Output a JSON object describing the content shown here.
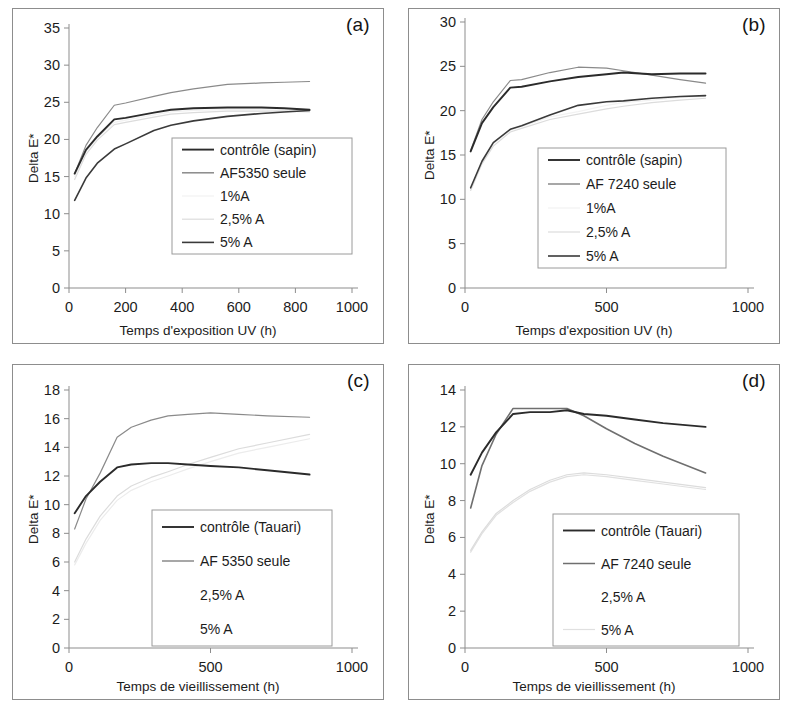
{
  "figure": {
    "background": "#ffffff",
    "axis_color": "#8d8d8d",
    "panel_count": 4
  },
  "colors": {
    "dark": "#2b2b2b",
    "mid_dark": "#4a4a4a",
    "gray": "#8a8a8a",
    "light_gray": "#c9c9c9",
    "very_light": "#e3e3e3",
    "frame": "#8d8d8d",
    "text": "#1c1c1c"
  },
  "panels": {
    "a": {
      "tag": "(a)",
      "ylabel": "Delta E*",
      "xlabel": "Temps d'exposition UV (h)",
      "legend": [
        {
          "label": "contrôle (sapin)",
          "color": "#2b2b2b",
          "width": 1.9,
          "show_line": true
        },
        {
          "label": "AF5350 seule",
          "color": "#8a8a8a",
          "width": 1.5,
          "show_line": true
        },
        {
          "label": "1%A",
          "color": "#f2f2f2",
          "width": 1.2,
          "show_line": true
        },
        {
          "label": "2,5% A",
          "color": "#dcdcdc",
          "width": 1.2,
          "show_line": true
        },
        {
          "label": "5% A",
          "color": "#3a3a3a",
          "width": 1.6,
          "show_line": true
        }
      ]
    },
    "b": {
      "tag": "(b)",
      "ylabel": "Delta E*",
      "xlabel": "Temps d'exposition UV (h)",
      "legend": [
        {
          "label": "contrôle (sapin)",
          "color": "#2b2b2b",
          "width": 1.9,
          "show_line": true
        },
        {
          "label": "AF 7240 seule",
          "color": "#8a8a8a",
          "width": 1.5,
          "show_line": true
        },
        {
          "label": "1%A",
          "color": "#f2f2f2",
          "width": 1.2,
          "show_line": true
        },
        {
          "label": "2,5% A",
          "color": "#dcdcdc",
          "width": 1.2,
          "show_line": true
        },
        {
          "label": "5% A",
          "color": "#3a3a3a",
          "width": 1.6,
          "show_line": true
        }
      ]
    },
    "c": {
      "tag": "(c)",
      "ylabel": "Delta E*",
      "xlabel": "Temps de vieillissement (h)",
      "legend": [
        {
          "label": "contrôle (Tauari)",
          "color": "#2b2b2b",
          "width": 1.9,
          "show_line": true
        },
        {
          "label": "AF 5350 seule",
          "color": "#8a8a8a",
          "width": 1.5,
          "show_line": true
        },
        {
          "label": "2,5% A",
          "color": "#dcdcdc",
          "width": 1.2,
          "show_line": false
        },
        {
          "label": "5% A",
          "color": "#ececec",
          "width": 1.2,
          "show_line": false
        }
      ]
    },
    "d": {
      "tag": "(d)",
      "ylabel": "Delta E*",
      "xlabel": "Temps de vieillissement (h)",
      "legend": [
        {
          "label": "contrôle (Tauari)",
          "color": "#2b2b2b",
          "width": 1.9,
          "show_line": true
        },
        {
          "label": "AF 7240 seule",
          "color": "#6f6f6f",
          "width": 1.5,
          "show_line": true
        },
        {
          "label": "2,5% A",
          "color": "#dcdcdc",
          "width": 1.2,
          "show_line": false
        },
        {
          "label": "5% A",
          "color": "#e0e0e0",
          "width": 1.2,
          "show_line": true
        }
      ]
    }
  },
  "chart_data": [
    {
      "id": "a",
      "type": "line",
      "title": "(a)",
      "xlabel": "Temps d'exposition UV (h)",
      "ylabel": "Delta E*",
      "xlim": [
        0,
        1000
      ],
      "ylim": [
        0,
        35
      ],
      "xticks": [
        0,
        200,
        400,
        600,
        800,
        1000
      ],
      "yticks": [
        0,
        5,
        10,
        15,
        20,
        25,
        30,
        35
      ],
      "grid": false,
      "legend_position": "center-right-inside",
      "series": [
        {
          "name": "contrôle (sapin)",
          "color": "#2b2b2b",
          "x": [
            20,
            60,
            100,
            160,
            200,
            300,
            360,
            440,
            560,
            680,
            760,
            850
          ],
          "y": [
            15.4,
            18.6,
            20.4,
            22.7,
            22.9,
            23.6,
            24.0,
            24.2,
            24.3,
            24.3,
            24.2,
            24.0
          ]
        },
        {
          "name": "AF5350 seule",
          "color": "#8a8a8a",
          "x": [
            20,
            60,
            100,
            160,
            200,
            300,
            360,
            440,
            560,
            680,
            760,
            850
          ],
          "y": [
            15.4,
            19.2,
            21.6,
            24.6,
            24.9,
            25.8,
            26.3,
            26.8,
            27.4,
            27.6,
            27.7,
            27.8
          ]
        },
        {
          "name": "1%A",
          "color": "#f2f2f2",
          "x": [
            20,
            60,
            100,
            160,
            200,
            300,
            360,
            440,
            560,
            680,
            760,
            850
          ],
          "y": [
            15.0,
            18.4,
            20.2,
            22.3,
            22.6,
            23.3,
            23.7,
            23.9,
            24.0,
            24.0,
            23.9,
            23.8
          ]
        },
        {
          "name": "2,5% A",
          "color": "#dcdcdc",
          "x": [
            20,
            60,
            100,
            160,
            200,
            300,
            360,
            440,
            560,
            680,
            760,
            850
          ],
          "y": [
            14.6,
            18.0,
            19.9,
            22.0,
            22.3,
            23.0,
            23.4,
            23.6,
            23.8,
            23.8,
            23.8,
            23.7
          ]
        },
        {
          "name": "5% A",
          "color": "#3a3a3a",
          "x": [
            20,
            60,
            100,
            160,
            200,
            300,
            360,
            440,
            560,
            680,
            760,
            850
          ],
          "y": [
            11.8,
            14.8,
            16.8,
            18.7,
            19.4,
            21.2,
            21.9,
            22.5,
            23.1,
            23.5,
            23.7,
            23.9
          ]
        }
      ]
    },
    {
      "id": "b",
      "type": "line",
      "title": "(b)",
      "xlabel": "Temps d'exposition UV (h)",
      "ylabel": "Delta E*",
      "xlim": [
        0,
        1000
      ],
      "ylim": [
        0,
        30
      ],
      "xticks": [
        0,
        500,
        1000
      ],
      "yticks": [
        0,
        5,
        10,
        15,
        20,
        25,
        30
      ],
      "grid": false,
      "legend_position": "center-right-inside",
      "series": [
        {
          "name": "contrôle (sapin)",
          "color": "#2b2b2b",
          "x": [
            20,
            60,
            100,
            160,
            200,
            300,
            400,
            500,
            560,
            660,
            760,
            850
          ],
          "y": [
            15.4,
            18.6,
            20.4,
            22.6,
            22.7,
            23.3,
            23.8,
            24.1,
            24.3,
            24.1,
            24.2,
            24.2
          ]
        },
        {
          "name": "AF 7240 seule",
          "color": "#8a8a8a",
          "x": [
            20,
            60,
            100,
            160,
            200,
            300,
            400,
            500,
            560,
            660,
            760,
            850
          ],
          "y": [
            15.5,
            19.0,
            21.0,
            23.4,
            23.5,
            24.3,
            24.9,
            24.8,
            24.5,
            24.0,
            23.5,
            23.1
          ]
        },
        {
          "name": "1%A",
          "color": "#f2f2f2",
          "x": [
            20,
            60,
            100,
            160,
            200,
            300,
            400,
            500,
            560,
            660,
            760,
            850
          ],
          "y": [
            11.2,
            14.2,
            16.3,
            17.8,
            18.2,
            19.3,
            19.9,
            20.6,
            20.9,
            21.2,
            21.5,
            21.6
          ]
        },
        {
          "name": "2,5% A",
          "color": "#dcdcdc",
          "x": [
            20,
            60,
            100,
            160,
            200,
            300,
            400,
            500,
            560,
            660,
            760,
            850
          ],
          "y": [
            11.0,
            14.0,
            16.0,
            17.6,
            18.0,
            19.0,
            19.6,
            20.2,
            20.5,
            20.9,
            21.2,
            21.4
          ]
        },
        {
          "name": "5% A",
          "color": "#3a3a3a",
          "x": [
            20,
            60,
            100,
            160,
            200,
            300,
            400,
            500,
            560,
            660,
            760,
            850
          ],
          "y": [
            11.3,
            14.3,
            16.4,
            17.9,
            18.3,
            19.5,
            20.6,
            21.0,
            21.1,
            21.4,
            21.6,
            21.7
          ]
        }
      ]
    },
    {
      "id": "c",
      "type": "line",
      "title": "(c)",
      "xlabel": "Temps de vieillissement (h)",
      "ylabel": "Delta E*",
      "xlim": [
        0,
        1000
      ],
      "ylim": [
        0,
        18
      ],
      "xticks": [
        0,
        500,
        1000
      ],
      "yticks": [
        0,
        2,
        4,
        6,
        8,
        10,
        12,
        14,
        16,
        18
      ],
      "grid": false,
      "legend_position": "center-right-inside",
      "series": [
        {
          "name": "contrôle (Tauari)",
          "color": "#2b2b2b",
          "x": [
            20,
            60,
            110,
            170,
            220,
            290,
            350,
            420,
            500,
            600,
            700,
            850
          ],
          "y": [
            9.4,
            10.6,
            11.6,
            12.6,
            12.8,
            12.9,
            12.9,
            12.8,
            12.7,
            12.6,
            12.4,
            12.1
          ]
        },
        {
          "name": "AF 5350 seule",
          "color": "#8a8a8a",
          "x": [
            20,
            60,
            110,
            170,
            220,
            290,
            350,
            420,
            500,
            600,
            700,
            850
          ],
          "y": [
            8.3,
            10.4,
            12.2,
            14.7,
            15.4,
            15.9,
            16.2,
            16.3,
            16.4,
            16.3,
            16.2,
            16.1
          ]
        },
        {
          "name": "2,5% A",
          "color": "#dcdcdc",
          "x": [
            20,
            60,
            110,
            170,
            220,
            290,
            350,
            420,
            500,
            600,
            700,
            850
          ],
          "y": [
            6.0,
            7.6,
            9.2,
            10.6,
            11.3,
            11.9,
            12.3,
            12.8,
            13.3,
            13.9,
            14.3,
            14.9
          ]
        },
        {
          "name": "5% A",
          "color": "#ececec",
          "x": [
            20,
            60,
            110,
            170,
            220,
            290,
            350,
            420,
            500,
            600,
            700,
            850
          ],
          "y": [
            5.8,
            7.3,
            8.9,
            10.3,
            11.0,
            11.6,
            12.0,
            12.5,
            13.0,
            13.6,
            14.0,
            14.6
          ]
        }
      ]
    },
    {
      "id": "d",
      "type": "line",
      "title": "(d)",
      "xlabel": "Temps de vieillissement (h)",
      "ylabel": "Delta E*",
      "xlim": [
        0,
        1000
      ],
      "ylim": [
        0,
        14
      ],
      "xticks": [
        0,
        500,
        1000
      ],
      "yticks": [
        0,
        2,
        4,
        6,
        8,
        10,
        12,
        14
      ],
      "grid": false,
      "legend_position": "center-right-inside",
      "series": [
        {
          "name": "contrôle (Tauari)",
          "color": "#2b2b2b",
          "x": [
            20,
            60,
            110,
            170,
            230,
            300,
            360,
            420,
            500,
            600,
            700,
            850
          ],
          "y": [
            9.4,
            10.6,
            11.7,
            12.7,
            12.8,
            12.8,
            12.9,
            12.7,
            12.6,
            12.4,
            12.2,
            12.0
          ]
        },
        {
          "name": "AF 7240 seule",
          "color": "#6f6f6f",
          "x": [
            20,
            60,
            110,
            170,
            230,
            300,
            360,
            420,
            500,
            600,
            700,
            850
          ],
          "y": [
            7.6,
            9.9,
            11.6,
            13.0,
            13.0,
            13.0,
            13.0,
            12.6,
            11.9,
            11.1,
            10.4,
            9.5
          ]
        },
        {
          "name": "2,5% A",
          "color": "#dcdcdc",
          "x": [
            20,
            60,
            110,
            170,
            230,
            300,
            360,
            420,
            500,
            600,
            700,
            850
          ],
          "y": [
            5.3,
            6.3,
            7.3,
            8.0,
            8.6,
            9.1,
            9.4,
            9.5,
            9.4,
            9.2,
            9.0,
            8.7
          ]
        },
        {
          "name": "5% A",
          "color": "#e0e0e0",
          "x": [
            20,
            60,
            110,
            170,
            230,
            300,
            360,
            420,
            500,
            600,
            700,
            850
          ],
          "y": [
            5.2,
            6.2,
            7.2,
            7.9,
            8.5,
            9.0,
            9.3,
            9.4,
            9.3,
            9.1,
            8.9,
            8.6
          ]
        }
      ]
    }
  ]
}
